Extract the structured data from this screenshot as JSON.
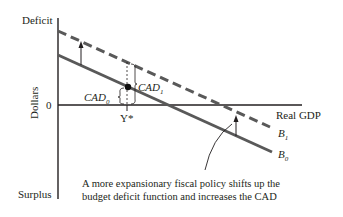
{
  "diagram": {
    "y_axis": {
      "top_label": "Deficit",
      "middle_label": "Dollars",
      "bottom_label": "Surplus",
      "zero_label": "0"
    },
    "x_axis": {
      "label": "Real GDP",
      "point_label": "Y*"
    },
    "curves": [
      {
        "id": "B0",
        "label_base": "B",
        "label_sub": "0",
        "style": "solid",
        "color": "#595959"
      },
      {
        "id": "B1",
        "label_base": "B",
        "label_sub": "1",
        "style": "dashed",
        "color": "#595959"
      }
    ],
    "brackets": [
      {
        "label_base": "CAD",
        "label_sub": "0"
      },
      {
        "label_base": "CAD",
        "label_sub": "1"
      }
    ],
    "caption_line1": "A more expansionary fiscal policy shifts up the",
    "caption_line2": "budget deficit function and increases the CAD"
  }
}
